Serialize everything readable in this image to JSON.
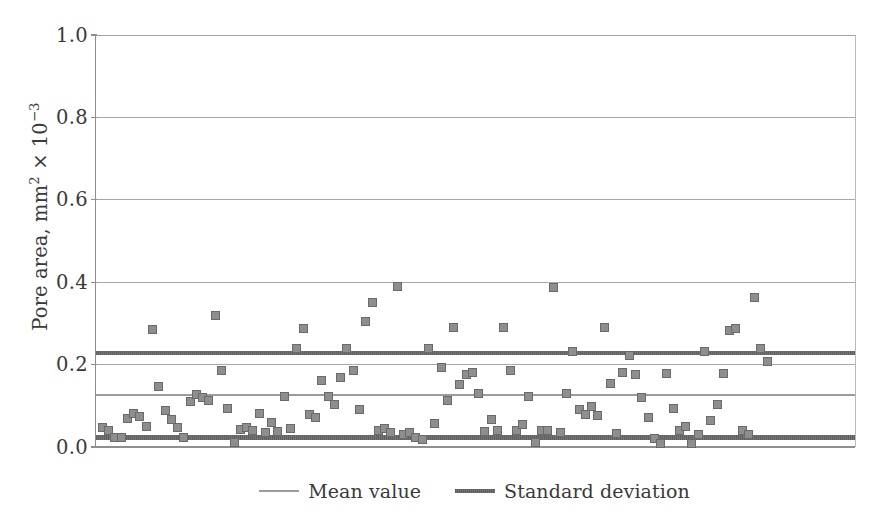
{
  "chart_data": {
    "type": "scatter",
    "title": "",
    "xlabel": "",
    "ylabel": "Pore area, mm2 x 10-3",
    "ylabel_parts": {
      "base": "Pore area, mm",
      "sup1": "2",
      "times": " × 10",
      "sup2": "−3"
    },
    "ylim": [
      0.0,
      1.0
    ],
    "ytick_labels": [
      "1.0",
      "0.8",
      "0.6",
      "0.4",
      "0.2",
      "0.0"
    ],
    "ytick_values": [
      1.0,
      0.8,
      0.6,
      0.4,
      0.2,
      0.0
    ],
    "grid": true,
    "grid_axis": "y",
    "xaxis_visible_ticks": false,
    "xlim": [
      0,
      121
    ],
    "legend_position": "below",
    "colors": {
      "marker_fill": "#8e8e8e",
      "marker_edge": "#6a6a6a",
      "mean_line": "#9b9b9b",
      "std_line": "#5f5f5f",
      "gridline": "#a9a9a9",
      "axis": "#8f8f8f",
      "text": "#3a3a3a",
      "background": "#ffffff"
    },
    "reference_lines": [
      {
        "name": "Standard deviation (upper)",
        "label": "Standard deviation",
        "value": 0.228,
        "style": "std"
      },
      {
        "name": "Mean value",
        "label": "Mean value",
        "value": 0.126,
        "style": "mean"
      },
      {
        "name": "Standard deviation (lower)",
        "label": "Standard deviation",
        "value": 0.023,
        "style": "std"
      }
    ],
    "legend": [
      {
        "label": "Mean value",
        "style": "mean"
      },
      {
        "label": "Standard deviation",
        "style": "std"
      }
    ],
    "series": [
      {
        "name": "Pore area",
        "marker": "square",
        "points": [
          [
            1,
            0.048
          ],
          [
            2,
            0.041
          ],
          [
            3,
            0.022
          ],
          [
            4,
            0.024
          ],
          [
            5,
            0.068
          ],
          [
            6,
            0.082
          ],
          [
            7,
            0.074
          ],
          [
            8,
            0.05
          ],
          [
            9,
            0.285
          ],
          [
            10,
            0.148
          ],
          [
            11,
            0.088
          ],
          [
            12,
            0.066
          ],
          [
            13,
            0.048
          ],
          [
            14,
            0.024
          ],
          [
            15,
            0.11
          ],
          [
            16,
            0.128
          ],
          [
            17,
            0.121
          ],
          [
            18,
            0.112
          ],
          [
            19,
            0.32
          ],
          [
            20,
            0.186
          ],
          [
            21,
            0.093
          ],
          [
            22,
            0.01
          ],
          [
            23,
            0.043
          ],
          [
            24,
            0.048
          ],
          [
            25,
            0.04
          ],
          [
            26,
            0.082
          ],
          [
            27,
            0.035
          ],
          [
            28,
            0.06
          ],
          [
            29,
            0.038
          ],
          [
            30,
            0.122
          ],
          [
            31,
            0.044
          ],
          [
            32,
            0.24
          ],
          [
            33,
            0.288
          ],
          [
            34,
            0.079
          ],
          [
            35,
            0.072
          ],
          [
            36,
            0.162
          ],
          [
            37,
            0.122
          ],
          [
            38,
            0.103
          ],
          [
            39,
            0.168
          ],
          [
            40,
            0.24
          ],
          [
            41,
            0.186
          ],
          [
            42,
            0.09
          ],
          [
            43,
            0.305
          ],
          [
            44,
            0.35
          ],
          [
            45,
            0.04
          ],
          [
            46,
            0.045
          ],
          [
            47,
            0.036
          ],
          [
            48,
            0.39
          ],
          [
            49,
            0.03
          ],
          [
            50,
            0.034
          ],
          [
            51,
            0.022
          ],
          [
            52,
            0.018
          ],
          [
            53,
            0.24
          ],
          [
            54,
            0.057
          ],
          [
            55,
            0.192
          ],
          [
            56,
            0.113
          ],
          [
            57,
            0.29
          ],
          [
            58,
            0.152
          ],
          [
            59,
            0.175
          ],
          [
            60,
            0.18
          ],
          [
            61,
            0.131
          ],
          [
            62,
            0.038
          ],
          [
            63,
            0.066
          ],
          [
            64,
            0.04
          ],
          [
            65,
            0.29
          ],
          [
            66,
            0.185
          ],
          [
            67,
            0.041
          ],
          [
            68,
            0.055
          ],
          [
            69,
            0.123
          ],
          [
            70,
            0.01
          ],
          [
            71,
            0.041
          ],
          [
            72,
            0.039
          ],
          [
            73,
            0.387
          ],
          [
            74,
            0.034
          ],
          [
            75,
            0.13
          ],
          [
            76,
            0.232
          ],
          [
            77,
            0.09
          ],
          [
            78,
            0.08
          ],
          [
            79,
            0.098
          ],
          [
            80,
            0.076
          ],
          [
            81,
            0.29
          ],
          [
            82,
            0.155
          ],
          [
            83,
            0.033
          ],
          [
            84,
            0.18
          ],
          [
            85,
            0.222
          ],
          [
            86,
            0.176
          ],
          [
            87,
            0.12
          ],
          [
            88,
            0.072
          ],
          [
            89,
            0.02
          ],
          [
            90,
            0.008
          ],
          [
            91,
            0.178
          ],
          [
            92,
            0.094
          ],
          [
            93,
            0.04
          ],
          [
            94,
            0.05
          ],
          [
            95,
            0.008
          ],
          [
            96,
            0.03
          ],
          [
            97,
            0.232
          ],
          [
            98,
            0.065
          ],
          [
            99,
            0.103
          ],
          [
            100,
            0.178
          ],
          [
            101,
            0.283
          ],
          [
            102,
            0.287
          ],
          [
            103,
            0.041
          ],
          [
            104,
            0.03
          ],
          [
            105,
            0.362
          ],
          [
            106,
            0.24
          ],
          [
            107,
            0.208
          ]
        ]
      }
    ]
  }
}
